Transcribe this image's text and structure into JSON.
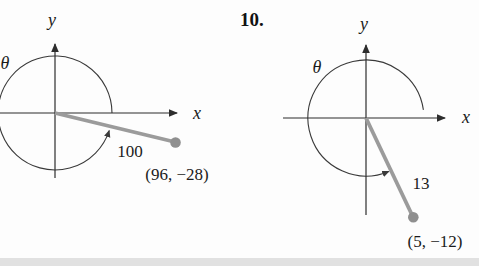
{
  "problem": {
    "number_label": "10."
  },
  "colors": {
    "axis": "#2d2d2d",
    "arc": "#3a3a3a",
    "vector": "#9b9b9b",
    "endpoint_dot": "#8f8f8f",
    "text": "#1b1b1b",
    "background": "#fdfdfd",
    "bottom_band": "#e1e1e1"
  },
  "diagrams": [
    {
      "id": "left",
      "y_axis_label": "y",
      "x_axis_label": "x",
      "angle_label": "θ",
      "radius_label": "100",
      "radius_value": 100,
      "point_label": "(96, −28)",
      "point": {
        "x": 96,
        "y": -28
      }
    },
    {
      "id": "right",
      "y_axis_label": "y",
      "x_axis_label": "x",
      "angle_label": "θ",
      "radius_label": "13",
      "radius_value": 13,
      "point_label": "(5, −12)",
      "point": {
        "x": 5,
        "y": -12
      }
    }
  ]
}
